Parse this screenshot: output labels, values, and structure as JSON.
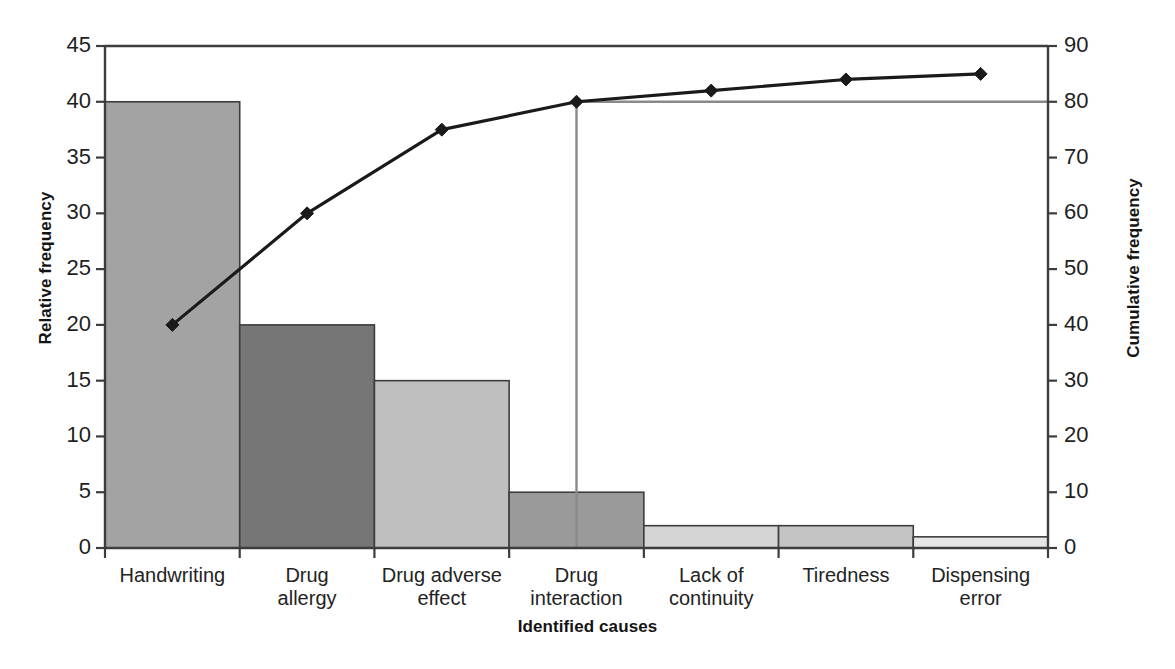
{
  "chart_data": {
    "type": "bar",
    "title": "",
    "subtitle": "",
    "xlabel": "Identified causes",
    "ylabel": "Relative frequency",
    "y2label": "Cumulative frequency",
    "categories": [
      "Handwriting",
      "Drug\nallergy",
      "Drug adverse\neffect",
      "Drug\ninteraction",
      "Lack of\ncontinuity",
      "Tiredness",
      "Dispensing\nerror"
    ],
    "series": [
      {
        "name": "Relative frequency",
        "kind": "bar",
        "axis": "left",
        "values": [
          40,
          20,
          15,
          5,
          2,
          2,
          1
        ],
        "colors": [
          "#a3a3a3",
          "#767676",
          "#bfbfbf",
          "#9a9a9a",
          "#d5d5d5",
          "#c4c4c4",
          "#e6e6e6"
        ]
      },
      {
        "name": "Cumulative frequency",
        "kind": "line",
        "axis": "right",
        "values": [
          40,
          60,
          75,
          80,
          82,
          84,
          85
        ],
        "color": "#1a1a1a",
        "marker": "diamond"
      }
    ],
    "ylim": [
      0,
      45
    ],
    "yticks": [
      0,
      5,
      10,
      15,
      20,
      25,
      30,
      35,
      40,
      45
    ],
    "y2lim": [
      0,
      90
    ],
    "y2ticks": [
      0,
      10,
      20,
      30,
      40,
      50,
      60,
      70,
      80,
      90
    ],
    "grid": false,
    "legend": false,
    "reference_lines": [
      {
        "name": "80-percent-line",
        "axis": "right",
        "value": 80,
        "orientation": "horizontal",
        "color": "#8a8a8a",
        "from_category_index": 3
      },
      {
        "name": "pareto-cutoff-line",
        "orientation": "vertical",
        "at_category_index": 3,
        "color": "#8a8a8a"
      }
    ]
  },
  "axes": {
    "left_ticks": [
      "0",
      "5",
      "10",
      "15",
      "20",
      "25",
      "30",
      "35",
      "40",
      "45"
    ],
    "right_ticks": [
      "0",
      "10",
      "20",
      "30",
      "40",
      "50",
      "60",
      "70",
      "80",
      "90"
    ],
    "left_title": "Relative frequency",
    "right_title": "Cumulative frequency",
    "x_title": "Identified causes"
  },
  "colors": {
    "axis": "#3d3d3d",
    "line": "#1a1a1a",
    "reference": "#8a8a8a",
    "background": "#ffffff"
  }
}
